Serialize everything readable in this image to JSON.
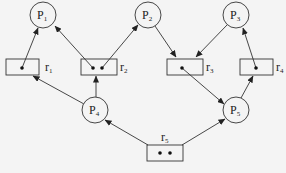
{
  "diagram": {
    "type": "resource-allocation-graph",
    "processes": [
      {
        "id": "P1",
        "label": "P",
        "sub": "1"
      },
      {
        "id": "P2",
        "label": "P",
        "sub": "2"
      },
      {
        "id": "P3",
        "label": "P",
        "sub": "3"
      },
      {
        "id": "P4",
        "label": "P",
        "sub": "4"
      },
      {
        "id": "P5",
        "label": "P",
        "sub": "5"
      }
    ],
    "resources": [
      {
        "id": "r1",
        "label": "r",
        "sub": "1",
        "instances": 1
      },
      {
        "id": "r2",
        "label": "r",
        "sub": "2",
        "instances": 2
      },
      {
        "id": "r3",
        "label": "r",
        "sub": "3",
        "instances": 1
      },
      {
        "id": "r4",
        "label": "r",
        "sub": "4",
        "instances": 1
      },
      {
        "id": "r5",
        "label": "r",
        "sub": "5",
        "instances": 2
      }
    ],
    "edges": [
      {
        "from": "r1",
        "to": "P1",
        "kind": "assignment"
      },
      {
        "from": "r2",
        "to": "P1",
        "kind": "assignment"
      },
      {
        "from": "r2",
        "to": "P2",
        "kind": "assignment"
      },
      {
        "from": "P2",
        "to": "r3",
        "kind": "request"
      },
      {
        "from": "P3",
        "to": "r3",
        "kind": "request"
      },
      {
        "from": "r4",
        "to": "P3",
        "kind": "assignment"
      },
      {
        "from": "P4",
        "to": "r1",
        "kind": "request"
      },
      {
        "from": "P4",
        "to": "r2",
        "kind": "request"
      },
      {
        "from": "r3",
        "to": "P5",
        "kind": "assignment"
      },
      {
        "from": "P5",
        "to": "r4",
        "kind": "request"
      },
      {
        "from": "r5",
        "to": "P4",
        "kind": "assignment"
      },
      {
        "from": "r5",
        "to": "P5",
        "kind": "assignment"
      }
    ]
  }
}
